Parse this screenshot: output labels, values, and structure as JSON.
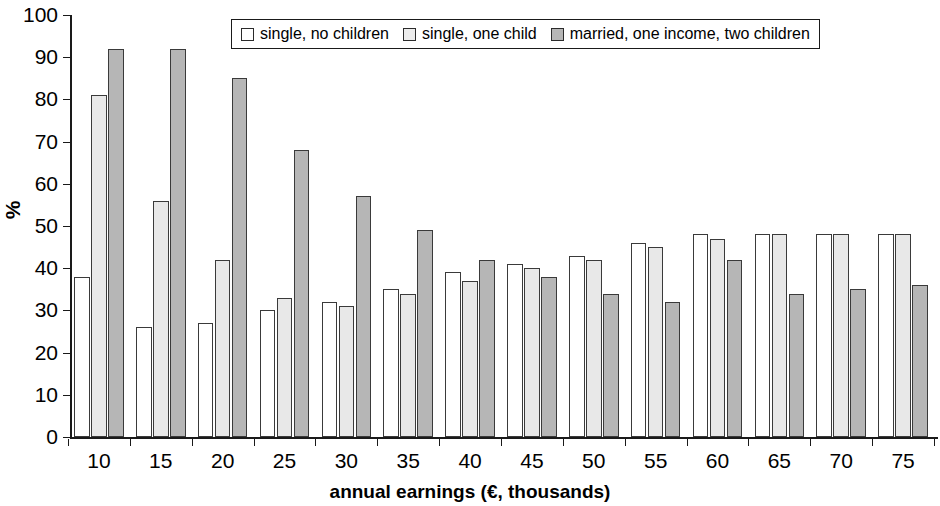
{
  "chart_data": {
    "type": "bar",
    "title": "",
    "xlabel": "annual earnings (€, thousands)",
    "ylabel": "%",
    "ylim": [
      0,
      100
    ],
    "ytick_step": 10,
    "yticks": [
      0,
      10,
      20,
      30,
      40,
      50,
      60,
      70,
      80,
      90,
      100
    ],
    "categories": [
      "10",
      "15",
      "20",
      "25",
      "30",
      "35",
      "40",
      "45",
      "50",
      "55",
      "60",
      "65",
      "70",
      "75"
    ],
    "grid": false,
    "legend_position": "top-center",
    "series": [
      {
        "name": "single, no children",
        "color": "#ffffff",
        "values": [
          38,
          26,
          27,
          30,
          32,
          35,
          39,
          41,
          43,
          46,
          48,
          48,
          48,
          48
        ]
      },
      {
        "name": "single, one child",
        "color": "#e8e8e8",
        "values": [
          81,
          56,
          42,
          33,
          31,
          34,
          37,
          40,
          42,
          45,
          47,
          48,
          48,
          48
        ]
      },
      {
        "name": "married, one income, two children",
        "color": "#b6b6b6",
        "values": [
          92,
          92,
          85,
          68,
          57,
          49,
          42,
          38,
          34,
          32,
          42,
          34,
          35,
          36
        ]
      }
    ]
  },
  "axis": {
    "y_title": "%",
    "x_title": "annual earnings (€, thousands)"
  },
  "legend": {
    "items": [
      {
        "label": "single, no children",
        "swatch": "white-swatch-icon"
      },
      {
        "label": "single, one child",
        "swatch": "light-gray-swatch-icon"
      },
      {
        "label": "married, one income, two children",
        "swatch": "gray-swatch-icon"
      }
    ]
  }
}
